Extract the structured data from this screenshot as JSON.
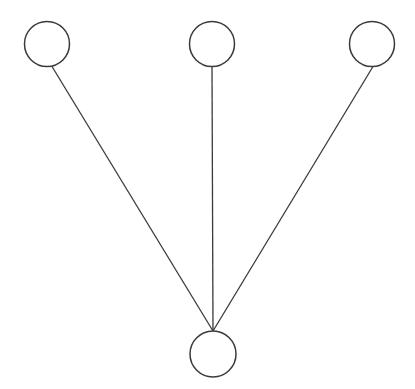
{
  "diagram": {
    "type": "tree",
    "width": 415,
    "height": 389,
    "stroke_color": "#3a3a3a",
    "fill_color": "#ffffff",
    "nodes": [
      {
        "id": "top-left",
        "label": "",
        "cx": 47,
        "cy": 44,
        "r": 22.5
      },
      {
        "id": "top-middle",
        "label": "",
        "cx": 212,
        "cy": 44,
        "r": 22.5
      },
      {
        "id": "top-right",
        "label": "",
        "cx": 372,
        "cy": 44,
        "r": 22.5
      },
      {
        "id": "bottom",
        "label": "",
        "cx": 213,
        "cy": 354,
        "r": 23
      }
    ],
    "edges": [
      {
        "from": "top-left",
        "to": "bottom",
        "x1": 52,
        "y1": 66.5,
        "x2": 213,
        "y2": 331
      },
      {
        "from": "top-middle",
        "to": "bottom",
        "x1": 212,
        "y1": 66.5,
        "x2": 213,
        "y2": 331
      },
      {
        "from": "top-right",
        "to": "bottom",
        "x1": 373,
        "y1": 66.5,
        "x2": 213,
        "y2": 331
      }
    ]
  }
}
